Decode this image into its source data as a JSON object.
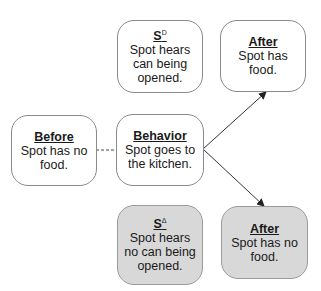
{
  "colors": {
    "box_border": "#8a8a8a",
    "shaded_fill": "#d8d8d8",
    "line": "#333333"
  },
  "boxes": {
    "before": {
      "title": "Before",
      "text": "Spot has no food.",
      "shaded": false
    },
    "behavior": {
      "title": "Behavior",
      "text": "Spot goes to the kitchen.",
      "shaded": false
    },
    "sd": {
      "title": "S",
      "superscript": "D",
      "text": "Spot hears can being opened.",
      "shaded": false
    },
    "sdelta": {
      "title": "S",
      "superscript": "Δ",
      "text": "Spot hears no can being opened.",
      "shaded": true
    },
    "after_food": {
      "title": "After",
      "text": "Spot has food.",
      "shaded": false
    },
    "after_nofood": {
      "title": "After",
      "text": "Spot has no food.",
      "shaded": true
    }
  },
  "connectors": [
    {
      "from": "before",
      "to": "behavior",
      "style": "dashed"
    },
    {
      "from": "behavior",
      "to": "after_food",
      "style": "arrow"
    },
    {
      "from": "behavior",
      "to": "after_nofood",
      "style": "arrow"
    }
  ]
}
